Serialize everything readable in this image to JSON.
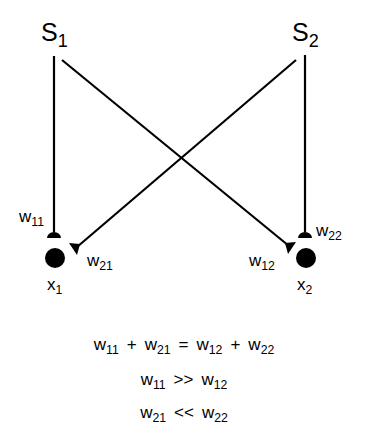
{
  "diagram": {
    "type": "neural-network-connection-diagram",
    "sources": [
      {
        "id": "s1",
        "base": "S",
        "sub": "1"
      },
      {
        "id": "s2",
        "base": "S",
        "sub": "2"
      }
    ],
    "targets": [
      {
        "id": "x1",
        "base": "x",
        "sub": "1"
      },
      {
        "id": "x2",
        "base": "x",
        "sub": "2"
      }
    ],
    "weights": [
      {
        "id": "w11",
        "base": "w",
        "sub": "11",
        "from": "S1",
        "to": "x1"
      },
      {
        "id": "w21",
        "base": "w",
        "sub": "21",
        "from": "S2",
        "to": "x1"
      },
      {
        "id": "w12",
        "base": "w",
        "sub": "12",
        "from": "S1",
        "to": "x2"
      },
      {
        "id": "w22",
        "base": "w",
        "sub": "22",
        "from": "S2",
        "to": "x2"
      }
    ],
    "colors": {
      "line": "#000000",
      "background": "#ffffff"
    }
  },
  "equations": [
    {
      "terms": [
        {
          "base": "w",
          "sub": "11"
        },
        {
          "op": "+"
        },
        {
          "base": "w",
          "sub": "21"
        },
        {
          "op": "="
        },
        {
          "base": "w",
          "sub": "12"
        },
        {
          "op": "+"
        },
        {
          "base": "w",
          "sub": "22"
        }
      ]
    },
    {
      "terms": [
        {
          "base": "w",
          "sub": "11"
        },
        {
          "op": ">>"
        },
        {
          "base": "w",
          "sub": "12"
        }
      ]
    },
    {
      "terms": [
        {
          "base": "w",
          "sub": "21"
        },
        {
          "op": "<<"
        },
        {
          "base": "w",
          "sub": "22"
        }
      ]
    }
  ]
}
